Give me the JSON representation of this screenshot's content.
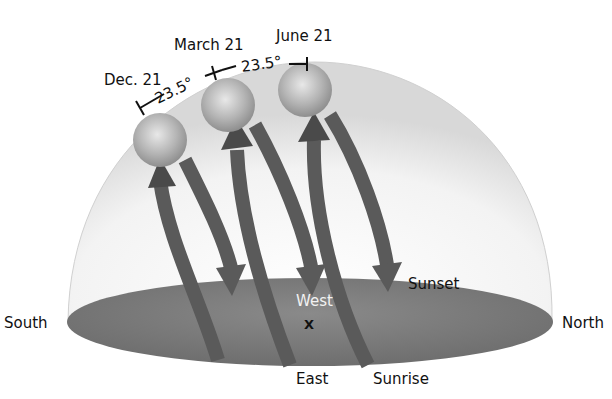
{
  "diagram": {
    "type": "sun-path-celestial-dome",
    "directions": {
      "south": "South",
      "north": "North",
      "east": "East",
      "west": "West",
      "observer_marker": "X"
    },
    "events": {
      "sunrise": "Sunrise",
      "sunset": "Sunset"
    },
    "dates": {
      "dec": "Dec. 21",
      "march": "March 21",
      "june": "June 21"
    },
    "angles": {
      "dec_to_march": "23.5°",
      "march_to_june": "23.5°"
    },
    "colors": {
      "ground": "#7d7d7d",
      "arrow": "#5e5e5e",
      "sun": "#b8b8b8",
      "dome": "#e6e6e6"
    }
  }
}
